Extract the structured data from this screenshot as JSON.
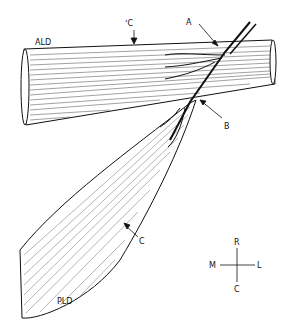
{
  "labels": {
    "ald": "ALD",
    "pld": "PLD",
    "a": "A",
    "b": "B",
    "c_top": "ʻC",
    "c_bottom": "C"
  },
  "compass": {
    "rostral": "R",
    "caudal": "C",
    "medial": "M",
    "lateral": "L"
  },
  "colors": {
    "ink": "#111111",
    "background": "#ffffff"
  }
}
